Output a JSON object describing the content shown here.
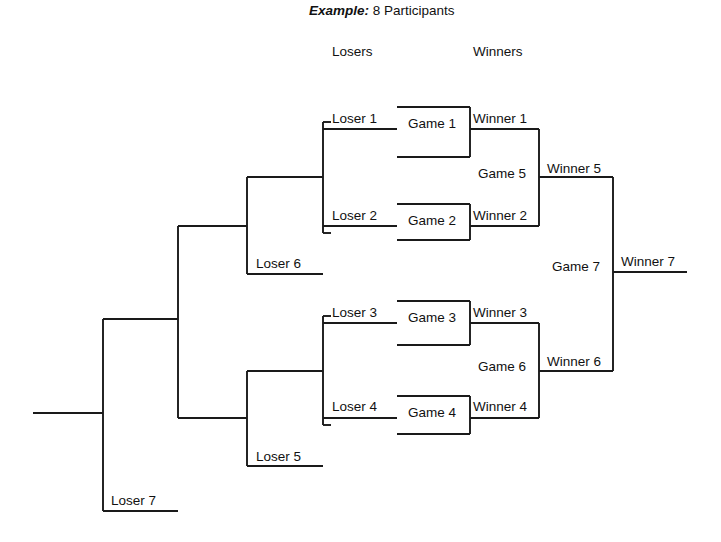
{
  "title": {
    "emphasis": "Example:",
    "text": " 8 Participants",
    "x": 309,
    "y": 4
  },
  "columns": [
    {
      "label": "Losers",
      "x": 332,
      "y": 45
    },
    {
      "label": "Winners",
      "x": 473,
      "y": 45
    }
  ],
  "labels": [
    {
      "name": "loser-1",
      "text": "Loser 1",
      "x": 332,
      "y": 112
    },
    {
      "name": "game-1",
      "text": "Game 1",
      "x": 408,
      "y": 117
    },
    {
      "name": "winner-1",
      "text": "Winner 1",
      "x": 473,
      "y": 112
    },
    {
      "name": "game-5",
      "text": "Game 5",
      "x": 478,
      "y": 167
    },
    {
      "name": "winner-5",
      "text": "Winner 5",
      "x": 547,
      "y": 162
    },
    {
      "name": "loser-2",
      "text": "Loser 2",
      "x": 332,
      "y": 209
    },
    {
      "name": "game-2",
      "text": "Game 2",
      "x": 408,
      "y": 214
    },
    {
      "name": "winner-2",
      "text": "Winner 2",
      "x": 473,
      "y": 209
    },
    {
      "name": "loser-6",
      "text": "Loser 6",
      "x": 256,
      "y": 257
    },
    {
      "name": "game-7",
      "text": "Game 7",
      "x": 552,
      "y": 260
    },
    {
      "name": "winner-7",
      "text": "Winner 7",
      "x": 621,
      "y": 255
    },
    {
      "name": "loser-3",
      "text": "Loser 3",
      "x": 332,
      "y": 306
    },
    {
      "name": "game-3",
      "text": "Game 3",
      "x": 408,
      "y": 311
    },
    {
      "name": "winner-3",
      "text": "Winner 3",
      "x": 473,
      "y": 306
    },
    {
      "name": "game-6",
      "text": "Game 6",
      "x": 478,
      "y": 360
    },
    {
      "name": "winner-6",
      "text": "Winner 6",
      "x": 547,
      "y": 355
    },
    {
      "name": "loser-4",
      "text": "Loser 4",
      "x": 332,
      "y": 400
    },
    {
      "name": "game-4",
      "text": "Game 4",
      "x": 408,
      "y": 406
    },
    {
      "name": "winner-4",
      "text": "Winner 4",
      "x": 473,
      "y": 400
    },
    {
      "name": "loser-5",
      "text": "Loser 5",
      "x": 256,
      "y": 450
    },
    {
      "name": "loser-7",
      "text": "Loser 7",
      "x": 111,
      "y": 494
    }
  ],
  "lines": {
    "color": "#1a1a1a",
    "width": 1.9,
    "segments": [
      {
        "name": "loser-1-line",
        "x1": 323,
        "y1": 129,
        "x2": 397,
        "y2": 129
      },
      {
        "name": "game-1-top",
        "x1": 397,
        "y1": 107,
        "x2": 470,
        "y2": 107
      },
      {
        "name": "game-1-right",
        "x1": 470,
        "y1": 107,
        "x2": 470,
        "y2": 157
      },
      {
        "name": "game-1-bottom",
        "x1": 397,
        "y1": 157,
        "x2": 470,
        "y2": 157
      },
      {
        "name": "winner-1-line",
        "x1": 470,
        "y1": 129,
        "x2": 539,
        "y2": 129
      },
      {
        "name": "loser-2-line",
        "x1": 323,
        "y1": 226,
        "x2": 397,
        "y2": 226
      },
      {
        "name": "game-2-top",
        "x1": 397,
        "y1": 204,
        "x2": 470,
        "y2": 204
      },
      {
        "name": "game-2-right",
        "x1": 470,
        "y1": 204,
        "x2": 470,
        "y2": 240
      },
      {
        "name": "game-2-bottom",
        "x1": 397,
        "y1": 240,
        "x2": 470,
        "y2": 240
      },
      {
        "name": "winner-2-line",
        "x1": 470,
        "y1": 226,
        "x2": 539,
        "y2": 226
      },
      {
        "name": "losers-12-vertical",
        "x1": 323,
        "y1": 122,
        "x2": 323,
        "y2": 233
      },
      {
        "name": "losers-12-top-stub",
        "x1": 323,
        "y1": 122,
        "x2": 331,
        "y2": 122
      },
      {
        "name": "losers-12-bot-stub",
        "x1": 323,
        "y1": 233,
        "x2": 331,
        "y2": 233
      },
      {
        "name": "game-5-vertical",
        "x1": 539,
        "y1": 129,
        "x2": 539,
        "y2": 226
      },
      {
        "name": "winner-5-line",
        "x1": 539,
        "y1": 177,
        "x2": 613,
        "y2": 177
      },
      {
        "name": "loser-6-bracket-v",
        "x1": 247,
        "y1": 177,
        "x2": 247,
        "y2": 274
      },
      {
        "name": "loser-6-top",
        "x1": 247,
        "y1": 177,
        "x2": 323,
        "y2": 177
      },
      {
        "name": "loser-6-bottom",
        "x1": 247,
        "y1": 274,
        "x2": 323,
        "y2": 274
      },
      {
        "name": "loser-6-out",
        "x1": 178,
        "y1": 226,
        "x2": 247,
        "y2": 226
      },
      {
        "name": "loser-3-line",
        "x1": 323,
        "y1": 323,
        "x2": 397,
        "y2": 323
      },
      {
        "name": "game-3-top",
        "x1": 397,
        "y1": 301,
        "x2": 470,
        "y2": 301
      },
      {
        "name": "game-3-right",
        "x1": 470,
        "y1": 301,
        "x2": 470,
        "y2": 345
      },
      {
        "name": "game-3-bottom",
        "x1": 397,
        "y1": 345,
        "x2": 470,
        "y2": 345
      },
      {
        "name": "winner-3-line",
        "x1": 470,
        "y1": 323,
        "x2": 539,
        "y2": 323
      },
      {
        "name": "loser-4-line",
        "x1": 323,
        "y1": 418,
        "x2": 397,
        "y2": 418
      },
      {
        "name": "game-4-top",
        "x1": 397,
        "y1": 396,
        "x2": 470,
        "y2": 396
      },
      {
        "name": "game-4-right",
        "x1": 470,
        "y1": 396,
        "x2": 470,
        "y2": 434
      },
      {
        "name": "game-4-bottom",
        "x1": 397,
        "y1": 434,
        "x2": 470,
        "y2": 434
      },
      {
        "name": "winner-4-line",
        "x1": 470,
        "y1": 418,
        "x2": 539,
        "y2": 418
      },
      {
        "name": "losers-34-vertical",
        "x1": 323,
        "y1": 316,
        "x2": 323,
        "y2": 425
      },
      {
        "name": "losers-34-top-stub",
        "x1": 323,
        "y1": 316,
        "x2": 331,
        "y2": 316
      },
      {
        "name": "losers-34-bot-stub",
        "x1": 323,
        "y1": 425,
        "x2": 331,
        "y2": 425
      },
      {
        "name": "game-6-vertical",
        "x1": 539,
        "y1": 323,
        "x2": 539,
        "y2": 418
      },
      {
        "name": "winner-6-line",
        "x1": 539,
        "y1": 371,
        "x2": 613,
        "y2": 371
      },
      {
        "name": "loser-5-bracket-v",
        "x1": 247,
        "y1": 371,
        "x2": 247,
        "y2": 466
      },
      {
        "name": "loser-5-top",
        "x1": 247,
        "y1": 371,
        "x2": 323,
        "y2": 371
      },
      {
        "name": "loser-5-bottom",
        "x1": 247,
        "y1": 466,
        "x2": 323,
        "y2": 466
      },
      {
        "name": "loser-5-out",
        "x1": 178,
        "y1": 418,
        "x2": 247,
        "y2": 418
      },
      {
        "name": "game-7-vertical",
        "x1": 613,
        "y1": 177,
        "x2": 613,
        "y2": 371
      },
      {
        "name": "winner-7-line",
        "x1": 613,
        "y1": 272,
        "x2": 687,
        "y2": 272
      },
      {
        "name": "losers-56-vertical",
        "x1": 178,
        "y1": 226,
        "x2": 178,
        "y2": 418
      },
      {
        "name": "loser-7-bracket-v",
        "x1": 103,
        "y1": 319,
        "x2": 103,
        "y2": 511
      },
      {
        "name": "loser-7-top",
        "x1": 103,
        "y1": 319,
        "x2": 178,
        "y2": 319
      },
      {
        "name": "loser-7-bottom",
        "x1": 103,
        "y1": 511,
        "x2": 178,
        "y2": 511
      },
      {
        "name": "root-stub",
        "x1": 33,
        "y1": 413,
        "x2": 103,
        "y2": 413
      }
    ]
  },
  "bracket_structure": {
    "participants": 8,
    "games": [
      {
        "id": "Game 1",
        "inputs": [
          "Loser 1"
        ],
        "winner": "Winner 1"
      },
      {
        "id": "Game 2",
        "inputs": [
          "Loser 2"
        ],
        "winner": "Winner 2"
      },
      {
        "id": "Game 3",
        "inputs": [
          "Loser 3"
        ],
        "winner": "Winner 3"
      },
      {
        "id": "Game 4",
        "inputs": [
          "Loser 4"
        ],
        "winner": "Winner 4"
      },
      {
        "id": "Game 5",
        "inputs": [
          "Winner 1",
          "Winner 2"
        ],
        "winner": "Winner 5",
        "loser": "Loser 6"
      },
      {
        "id": "Game 6",
        "inputs": [
          "Winner 3",
          "Winner 4"
        ],
        "winner": "Winner 6",
        "loser": "Loser 5"
      },
      {
        "id": "Game 7",
        "inputs": [
          "Winner 5",
          "Winner 6"
        ],
        "winner": "Winner 7",
        "loser": "Loser 7"
      }
    ]
  }
}
